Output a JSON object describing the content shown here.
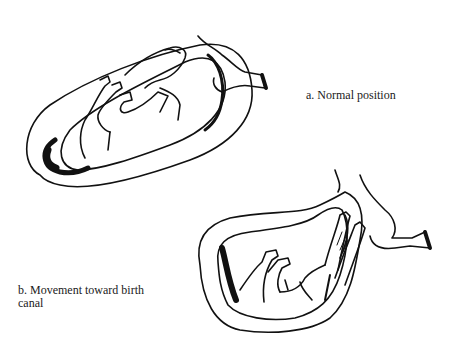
{
  "figure": {
    "panels": [
      {
        "id": "a",
        "caption": "a. Normal position",
        "description": "Foal in uterus, dorsal position, head and forelegs toward cervix"
      },
      {
        "id": "b",
        "caption_line1": "b. Movement toward birth",
        "caption_line2": "canal",
        "description": "Foal rotating with forelegs and head entering the birth canal"
      }
    ],
    "ink_color": "#111111",
    "background_color": "#ffffff"
  }
}
